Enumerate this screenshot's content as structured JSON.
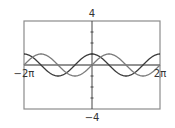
{
  "chart_data": {
    "type": "line",
    "title": "",
    "xlabel": "",
    "ylabel": "",
    "xlim": [
      "-2π",
      "2π"
    ],
    "xlim_numeric": [
      -6.2832,
      6.2832
    ],
    "ylim": [
      -4,
      4
    ],
    "grid": false,
    "legend": null,
    "x_tick_labels": [
      "−2π",
      "2π"
    ],
    "y_tick_labels": [
      "4",
      "−4"
    ],
    "y_tick_step": 1,
    "series": [
      {
        "name": "y = cos x",
        "function": "cos",
        "amplitude": 1,
        "color": "#3a3a3a"
      },
      {
        "name": "y = sin x",
        "function": "sin",
        "amplitude": 1,
        "color": "#7a7a7a"
      }
    ],
    "sample_points": {
      "x": [
        "-2π",
        "-3π/2",
        "-π",
        "-π/2",
        "0",
        "π/2",
        "π",
        "3π/2",
        "2π"
      ],
      "cos": [
        1,
        0,
        -1,
        0,
        1,
        0,
        -1,
        0,
        1
      ],
      "sin": [
        0,
        1,
        0,
        -1,
        0,
        1,
        0,
        -1,
        0
      ]
    }
  },
  "labels": {
    "y_max": "4",
    "y_min": "−4",
    "x_min": "−2π",
    "x_max": "2π"
  },
  "colors": {
    "frame": "#8c8c8c",
    "axis": "#6e6e6e",
    "text": "#333333"
  }
}
